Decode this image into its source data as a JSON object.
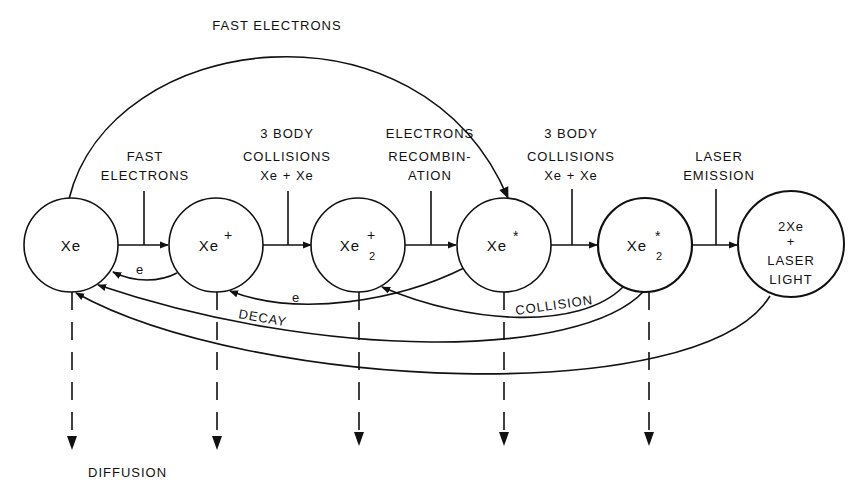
{
  "diagram": {
    "title_arc_label": "FAST ELECTRONS",
    "nodes": [
      {
        "id": "xe",
        "label": "Xe",
        "sup": "",
        "sub": ""
      },
      {
        "id": "xe_ion",
        "label": "Xe",
        "sup": "+",
        "sub": ""
      },
      {
        "id": "xe2_ion",
        "label": "Xe",
        "sup": "+",
        "sub": "2"
      },
      {
        "id": "xe_excited",
        "label": "Xe",
        "sup": "*",
        "sub": ""
      },
      {
        "id": "xe2_excited",
        "label": "Xe",
        "sup": "*",
        "sub": "2"
      },
      {
        "id": "product",
        "lines": [
          "2Xe",
          "+",
          "LASER",
          "LIGHT"
        ]
      }
    ],
    "process_labels": [
      {
        "lines": [
          "FAST",
          "ELECTRONS"
        ]
      },
      {
        "lines": [
          "3 BODY",
          "COLLISIONS",
          "Xe + Xe"
        ]
      },
      {
        "lines": [
          "ELECTRONS",
          "RECOMBIN-",
          "ATION"
        ]
      },
      {
        "lines": [
          "3 BODY",
          "COLLISIONS",
          "Xe + Xe"
        ]
      },
      {
        "lines": [
          "LASER",
          "EMISSION"
        ]
      }
    ],
    "return_labels": {
      "electron_1": "e",
      "electron_2": "e",
      "decay": "DECAY",
      "collision": "COLLISION"
    },
    "diffusion_label": "DIFFUSION"
  }
}
